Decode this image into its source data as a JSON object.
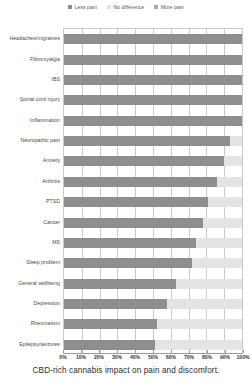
{
  "caption": "CBD-rich cannabis impact on pain and discomfort.",
  "legend": {
    "items": [
      {
        "label": "Less pain",
        "color": "#8e8e8e",
        "icon": "square-swatch-icon"
      },
      {
        "label": "No difference",
        "color": "#e4e4e4",
        "icon": "square-swatch-icon"
      },
      {
        "label": "More pain",
        "color": "#a8a8a8",
        "icon": "square-swatch-icon"
      }
    ]
  },
  "axis": {
    "x_ticks": [
      "0%",
      "10%",
      "20%",
      "30%",
      "40%",
      "50%",
      "60%",
      "70%",
      "80%",
      "90%",
      "100%"
    ]
  },
  "chart_data": {
    "type": "bar",
    "orientation": "horizontal",
    "stacked": true,
    "title": "",
    "subtitle": "",
    "xlabel": "",
    "ylabel": "",
    "xlim": [
      0,
      100
    ],
    "grid": true,
    "legend_position": "top-center",
    "tick_labels_x": [
      "0%",
      "10%",
      "20%",
      "30%",
      "40%",
      "50%",
      "60%",
      "70%",
      "80%",
      "90%",
      "100%"
    ],
    "categories": [
      "Headaches/migraines",
      "Fibromyalgia",
      "IBS",
      "Spinal cord injury",
      "Inflammation",
      "Neuropathic pain",
      "Anxiety",
      "Arthritis",
      "PTSD",
      "Cancer",
      "MS",
      "Sleep problem",
      "General wellbeing",
      "Depression",
      "Rheumatism",
      "Epilepsy/seizures"
    ],
    "series": [
      {
        "name": "Less pain",
        "color": "#8e8e8e",
        "values": [
          100,
          100,
          100,
          100,
          100,
          93,
          90,
          86,
          81,
          78,
          74,
          72,
          63,
          58,
          52,
          51
        ]
      },
      {
        "name": "No difference",
        "color": "#e4e4e4",
        "values": [
          0,
          0,
          0,
          0,
          0,
          7,
          10,
          14,
          19,
          22,
          26,
          28,
          37,
          42,
          48,
          49
        ]
      },
      {
        "name": "More pain",
        "color": "#a8a8a8",
        "values": [
          0,
          0,
          0,
          0,
          0,
          0,
          0,
          0,
          0,
          0,
          0,
          0,
          0,
          0,
          0,
          0
        ]
      }
    ]
  }
}
